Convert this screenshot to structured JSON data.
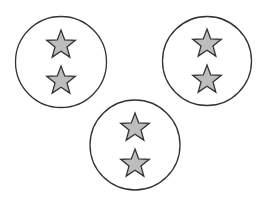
{
  "diagram": {
    "colors": {
      "background": "#ffffff",
      "circle_stroke": "#333333",
      "star_fill": "#bdbdbd",
      "star_stroke": "#333333"
    },
    "groups": [
      {
        "name": "top-left",
        "cx": 61,
        "cy": 62,
        "r": 45.5,
        "stars": 2
      },
      {
        "name": "top-right",
        "cx": 207,
        "cy": 61,
        "r": 44.5,
        "stars": 2
      },
      {
        "name": "bottom-center",
        "cx": 135,
        "cy": 145,
        "r": 45,
        "stars": 2
      }
    ]
  }
}
